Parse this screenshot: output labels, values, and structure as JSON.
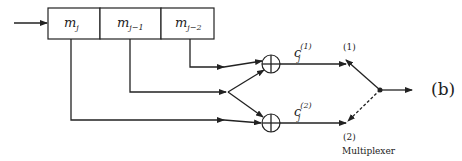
{
  "diagram": {
    "register_cells": [
      {
        "symbol": "m",
        "subscript": "j"
      },
      {
        "symbol": "m",
        "subscript": "j−1"
      },
      {
        "symbol": "m",
        "subscript": "j−2"
      }
    ],
    "outputs": [
      {
        "symbol": "c",
        "subscript": "j",
        "superscript": "(1)",
        "port_label": "(1)"
      },
      {
        "symbol": "c",
        "subscript": "j",
        "superscript": "(2)",
        "port_label": "(2)"
      }
    ],
    "adder_symbol": "⊕",
    "multiplexer_label": "Multiplexer",
    "figure_label": "(b)"
  }
}
